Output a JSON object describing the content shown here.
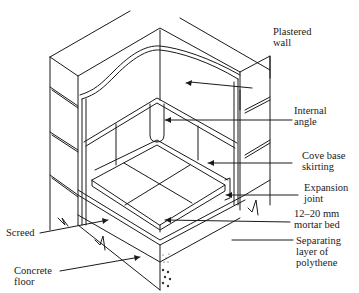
{
  "diagram": {
    "type": "isometric cutaway",
    "labels": [
      {
        "id": "plastered-wall",
        "lines": [
          "Plastered",
          "wall"
        ]
      },
      {
        "id": "internal-angle",
        "lines": [
          "Internal",
          "angle"
        ]
      },
      {
        "id": "cove-base-skirting",
        "lines": [
          "Cove base",
          "skirting"
        ]
      },
      {
        "id": "expansion-joint",
        "lines": [
          "Expansion",
          "joint"
        ]
      },
      {
        "id": "mortar-bed",
        "lines": [
          "12–20 mm",
          "mortar bed"
        ]
      },
      {
        "id": "separating-layer",
        "lines": [
          "Separating",
          "layer of",
          "polythene"
        ]
      },
      {
        "id": "screed",
        "lines": [
          "Screed"
        ]
      },
      {
        "id": "concrete-floor",
        "lines": [
          "Concrete",
          "floor"
        ]
      }
    ]
  },
  "colors": {
    "line": "#1a1a1a",
    "background": "#ffffff"
  }
}
